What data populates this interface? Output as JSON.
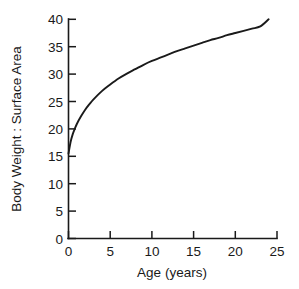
{
  "chart_data": {
    "type": "line",
    "title": "",
    "xlabel": "Age (years)",
    "ylabel": "Body Weight : Surface Area",
    "xlim": [
      0,
      25
    ],
    "ylim": [
      0,
      40
    ],
    "xticks": [
      0,
      5,
      10,
      15,
      20,
      25
    ],
    "xticklabels": [
      "0",
      "5",
      "10",
      "15",
      "20",
      "25"
    ],
    "yticks": [
      0,
      5,
      10,
      15,
      20,
      25,
      30,
      35,
      40
    ],
    "yticklabels": [
      "0",
      "5",
      "10",
      "15",
      "20",
      "25",
      "30",
      "35",
      "40"
    ],
    "grid": false,
    "legend": null,
    "series": [
      {
        "name": "Body Weight : Surface Area",
        "color": "#1a1a1a",
        "x": [
          0,
          0.25,
          0.5,
          0.75,
          1,
          1.5,
          2,
          2.5,
          3,
          4,
          5,
          6,
          7,
          8,
          9,
          10,
          11,
          12,
          13,
          14,
          15,
          16,
          17,
          18,
          19,
          20,
          21,
          22,
          23,
          24
        ],
        "values": [
          15.5,
          17.6,
          19.0,
          20.0,
          20.9,
          22.3,
          23.5,
          24.5,
          25.4,
          26.9,
          28.1,
          29.2,
          30.1,
          30.9,
          31.7,
          32.4,
          33.0,
          33.6,
          34.2,
          34.7,
          35.2,
          35.7,
          36.2,
          36.6,
          37.1,
          37.5,
          37.9,
          38.3,
          38.7,
          40.0
        ]
      }
    ]
  },
  "figure": {
    "background_color": "#ffffff",
    "axis_color": "#1a1a1a",
    "curve_color": "#1a1a1a"
  }
}
